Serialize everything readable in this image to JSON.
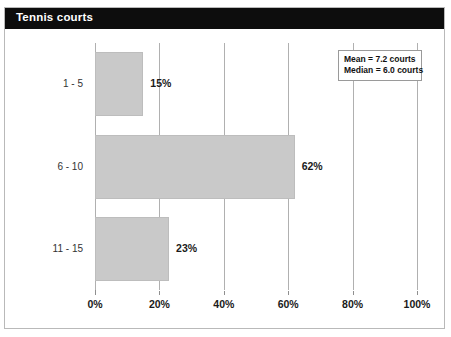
{
  "title": "Tennis courts",
  "chart_data": {
    "type": "bar",
    "orientation": "horizontal",
    "title": "Tennis courts",
    "categories": [
      "1 - 5",
      "6 - 10",
      "11 - 15"
    ],
    "values": [
      15,
      62,
      23
    ],
    "value_labels": [
      "15%",
      "62%",
      "23%"
    ],
    "xlabel": "",
    "ylabel": "",
    "xlim": [
      0,
      100
    ],
    "xticks": [
      0,
      20,
      40,
      60,
      80,
      100
    ],
    "xtick_labels": [
      "0%",
      "20%",
      "40%",
      "60%",
      "80%",
      "100%"
    ],
    "grid": "vertical",
    "legend": "none",
    "bar_color": "#c9c9c9",
    "annotations": [
      "Mean = 7.2 courts",
      "Median = 6.0 courts"
    ]
  },
  "stats": {
    "mean": "Mean = 7.2 courts",
    "median": "Median = 6.0 courts"
  }
}
